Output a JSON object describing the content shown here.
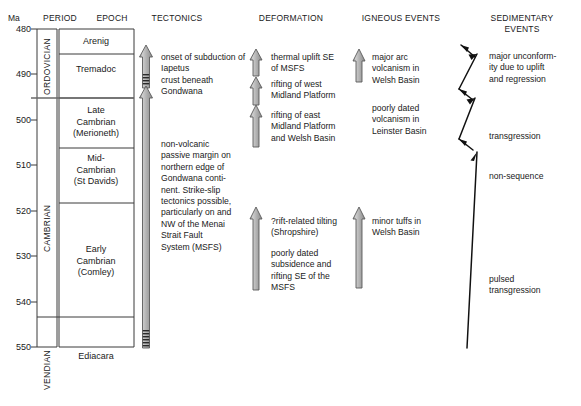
{
  "axis": {
    "unit_header": "Ma",
    "ticks": [
      480,
      490,
      500,
      510,
      520,
      530,
      540,
      550
    ],
    "range": [
      480,
      551
    ]
  },
  "columns": [
    {
      "id": "period",
      "header": "PERIOD"
    },
    {
      "id": "epoch",
      "header": "EPOCH"
    },
    {
      "id": "tectonics",
      "header": "TECTONICS"
    },
    {
      "id": "deformation",
      "header": "DEFORMATION"
    },
    {
      "id": "igneous",
      "header": "IGNEOUS EVENTS"
    },
    {
      "id": "sedimentary",
      "header": "SEDIMENTARY\nEVENTS"
    }
  ],
  "periods": [
    {
      "name": "ORDOVICIAN",
      "top_ma": 480,
      "bottom_ma": 495.5
    },
    {
      "name": "CAMBRIAN",
      "top_ma": 495.5,
      "bottom_ma": 544.5
    },
    {
      "name": "VENDIAN",
      "top_ma": 544.5,
      "bottom_ma": 551
    }
  ],
  "epochs": [
    {
      "name": "Arenig",
      "top_ma": 480,
      "bottom_ma": 485.5
    },
    {
      "name": "Tremadoc",
      "top_ma": 485.5,
      "bottom_ma": 495.5
    },
    {
      "name": "Late\nCambrian\n(Merioneth)",
      "top_ma": 495.5,
      "bottom_ma": 506.5
    },
    {
      "name": "Mid-\nCambrian\n(St Davids)",
      "top_ma": 506.5,
      "bottom_ma": 518.5
    },
    {
      "name": "Early\nCambrian\n(Comley)",
      "top_ma": 518.5,
      "bottom_ma": 544.5
    },
    {
      "name": "Ediacara",
      "top_ma": 544.5,
      "bottom_ma": 551
    }
  ],
  "tectonics": {
    "events": [
      {
        "label": "onset of subduction of Iapetus\ncrust beneath\nGondwana"
      },
      {
        "label": "non-volcanic\npassive margin on\nnorthern edge of\nGondwana conti-\nnent. Strike-slip\ntectonics possible,\nparticularly on and\nNW of the Menai\nStrait Fault\nSystem (MSFS)"
      }
    ]
  },
  "deformation": {
    "events": [
      {
        "label": "thermal uplift SE\nof MSFS"
      },
      {
        "label": "rifting of west\nMidland Platform"
      },
      {
        "label": "rifting of east\nMidland Platform\nand Welsh Basin"
      },
      {
        "label": "?rift-related tilting\n(Shropshire)"
      },
      {
        "label": "poorly dated\nsubsidence and\nrifting SE of the\nMSFS"
      }
    ]
  },
  "igneous": {
    "events": [
      {
        "label": "major arc\nvolcanism in\nWelsh Basin"
      },
      {
        "label": "poorly dated\nvolcanism in\nLeinster Basin"
      },
      {
        "label": "minor tuffs in\nWelsh Basin"
      }
    ]
  },
  "sedimentary": {
    "events": [
      {
        "label": "major unconform-\nity due to uplift\nand regression"
      },
      {
        "label": "transgression"
      },
      {
        "label": "non-sequence"
      },
      {
        "label": "pulsed\ntransgression"
      }
    ]
  },
  "colors": {
    "line": "#3a3a3a",
    "arrow_fill": "#b8b8b8",
    "arrow_stroke": "#555555",
    "text": "#1a1a1a",
    "sed_arrow": "#111111"
  }
}
